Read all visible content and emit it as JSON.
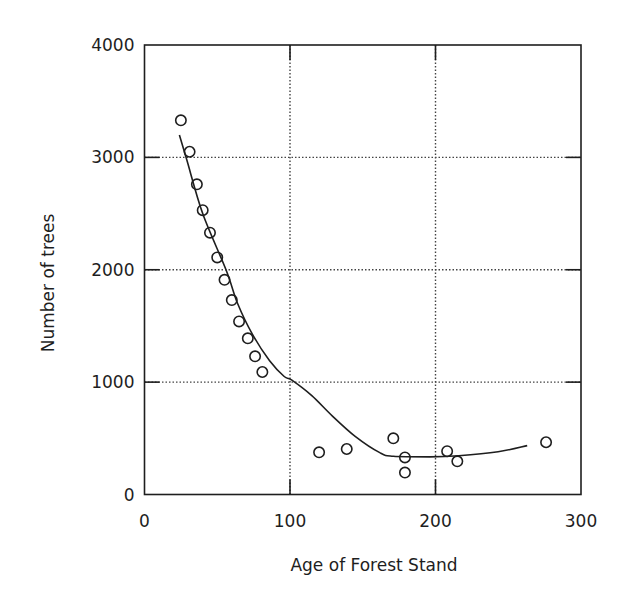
{
  "chart_data": {
    "type": "scatter",
    "title": "",
    "xlabel": "Age of Forest Stand",
    "ylabel": "Number of trees",
    "xlim": [
      0,
      300
    ],
    "ylim": [
      0,
      4000
    ],
    "x_ticks": [
      0,
      100,
      200,
      300
    ],
    "y_ticks": [
      0,
      1000,
      2000,
      3000,
      4000
    ],
    "x_tick_labels": [
      "0",
      "100",
      "200",
      "300"
    ],
    "y_tick_labels": [
      "0",
      "1000",
      "2000",
      "3000",
      "4000"
    ],
    "grid": {
      "on": true,
      "style": "dotted",
      "x": [
        100,
        200
      ],
      "y": [
        1000,
        2000,
        3000
      ]
    },
    "legend": null,
    "series": [
      {
        "name": "Observed stands",
        "kind": "scatter",
        "marker": "open-circle",
        "points": [
          [
            25,
            3330
          ],
          [
            31,
            3050
          ],
          [
            36,
            2760
          ],
          [
            40,
            2530
          ],
          [
            45,
            2330
          ],
          [
            50,
            2110
          ],
          [
            55,
            1910
          ],
          [
            60,
            1730
          ],
          [
            65,
            1540
          ],
          [
            71,
            1390
          ],
          [
            76,
            1230
          ],
          [
            81,
            1090
          ],
          [
            120,
            375
          ],
          [
            139,
            405
          ],
          [
            171,
            500
          ],
          [
            179,
            330
          ],
          [
            179,
            195
          ],
          [
            208,
            385
          ],
          [
            215,
            295
          ],
          [
            276,
            465
          ]
        ]
      },
      {
        "name": "Fitted trend",
        "kind": "line",
        "points": [
          [
            24,
            3200
          ],
          [
            29,
            2980
          ],
          [
            40,
            2500
          ],
          [
            56,
            2000
          ],
          [
            64,
            1700
          ],
          [
            74,
            1430
          ],
          [
            86,
            1190
          ],
          [
            96,
            1050
          ],
          [
            101,
            1020
          ],
          [
            115,
            880
          ],
          [
            129,
            700
          ],
          [
            145,
            515
          ],
          [
            162,
            370
          ],
          [
            171,
            340
          ],
          [
            196,
            335
          ],
          [
            216,
            345
          ],
          [
            243,
            380
          ],
          [
            263,
            435
          ]
        ]
      }
    ],
    "colors": {
      "ink": "#1e1e1e",
      "grid": "#444444",
      "background": "#ffffff"
    }
  }
}
